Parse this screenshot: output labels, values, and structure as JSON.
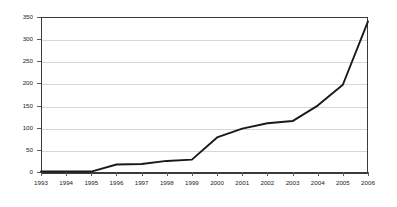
{
  "chart_data": {
    "type": "line",
    "title": "",
    "subtitle": "",
    "xlabel": "",
    "ylabel": "",
    "categories": [
      "1993",
      "1994",
      "1995",
      "1996",
      "1997",
      "1998",
      "1999",
      "2000",
      "2001",
      "2002",
      "2003",
      "2004",
      "2005",
      "2006"
    ],
    "values": [
      1,
      1,
      1,
      17,
      18,
      25,
      28,
      78,
      98,
      110,
      115,
      150,
      197,
      340
    ],
    "series": [
      {
        "name": "",
        "values": [
          1,
          1,
          1,
          17,
          18,
          25,
          28,
          78,
          98,
          110,
          115,
          150,
          197,
          340
        ]
      }
    ],
    "ylim": [
      0,
      350
    ],
    "yticks": [
      0,
      50,
      100,
      150,
      200,
      250,
      300,
      350
    ],
    "ytick_labels": [
      "0",
      "50",
      "100",
      "150",
      "200",
      "250",
      "300",
      "350"
    ],
    "xtick_labels": [
      "1993",
      "1994",
      "1995",
      "1996",
      "1997",
      "1998",
      "1999",
      "2000",
      "2001",
      "2002",
      "2003",
      "2004",
      "2005",
      "2006"
    ],
    "grid": true,
    "grid_axis": "y",
    "legend": false,
    "legend_position": "none",
    "annotations": []
  },
  "style": {
    "line_color": "#1a1a1a",
    "grid_color": "#d6d6d6",
    "axis_color": "#3b3b3b",
    "tick_color": "#5a5a5a",
    "text_color": "#222222",
    "background": "#ffffff"
  }
}
